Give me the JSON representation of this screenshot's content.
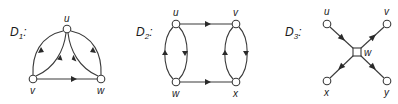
{
  "diagrams": [
    {
      "id": "D1",
      "label": "D",
      "subscript": "1",
      "suffix": ":",
      "nodes": [
        {
          "name": "u",
          "x": 67,
          "y": 29
        },
        {
          "name": "v",
          "x": 33,
          "y": 79
        },
        {
          "name": "w",
          "x": 101,
          "y": 79
        }
      ],
      "edges": [
        {
          "from": "u",
          "to": "v",
          "shape": "outer-left-arc"
        },
        {
          "from": "v",
          "to": "u",
          "shape": "inner-left-arc"
        },
        {
          "from": "u",
          "to": "w",
          "shape": "inner-right-arc"
        },
        {
          "from": "w",
          "to": "u",
          "shape": "outer-right-arc"
        },
        {
          "from": "v",
          "to": "w",
          "shape": "straight"
        }
      ]
    },
    {
      "id": "D2",
      "label": "D",
      "subscript": "2",
      "suffix": ":",
      "nodes": [
        {
          "name": "u",
          "x": 176,
          "y": 24
        },
        {
          "name": "v",
          "x": 236,
          "y": 24
        },
        {
          "name": "w",
          "x": 176,
          "y": 82
        },
        {
          "name": "x",
          "x": 236,
          "y": 82
        }
      ],
      "edges": [
        {
          "from": "u",
          "to": "v",
          "shape": "straight"
        },
        {
          "from": "w",
          "to": "x",
          "shape": "straight"
        },
        {
          "from": "w",
          "to": "u",
          "shape": "left-arc"
        },
        {
          "from": "u",
          "to": "w",
          "shape": "right-arc"
        },
        {
          "from": "x",
          "to": "v",
          "shape": "left-arc"
        },
        {
          "from": "v",
          "to": "x",
          "shape": "right-arc"
        }
      ]
    },
    {
      "id": "D3",
      "label": "D",
      "subscript": "3",
      "suffix": ":",
      "nodes": [
        {
          "name": "u",
          "x": 327,
          "y": 24
        },
        {
          "name": "v",
          "x": 387,
          "y": 24
        },
        {
          "name": "w",
          "x": 357,
          "y": 52
        },
        {
          "name": "x",
          "x": 327,
          "y": 81
        },
        {
          "name": "y",
          "x": 387,
          "y": 81
        }
      ],
      "edges": [
        {
          "from": "u",
          "to": "w",
          "shape": "straight"
        },
        {
          "from": "w",
          "to": "v",
          "shape": "straight"
        },
        {
          "from": "w",
          "to": "x",
          "shape": "straight"
        },
        {
          "from": "w",
          "to": "y",
          "shape": "straight"
        }
      ]
    }
  ]
}
